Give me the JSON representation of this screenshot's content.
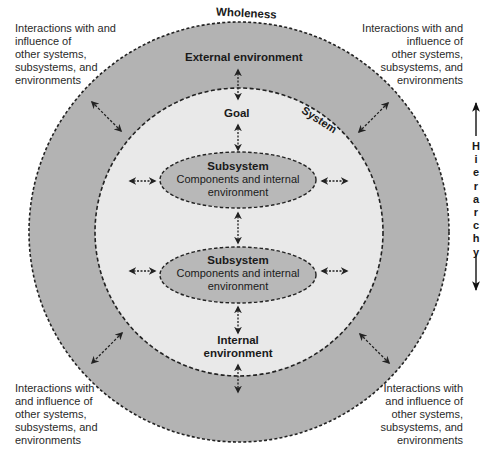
{
  "diagram": {
    "type": "nested-systems-diagram",
    "colors": {
      "background": "#ffffff",
      "outer_ring": "#b3b3b3",
      "inner_circle": "#e9e9e9",
      "subsystem_fill": "#b8b8b8",
      "outline": "#222222",
      "text": "#1a1a1a"
    },
    "labels": {
      "wholeness": "Wholeness",
      "external_environment": "External environment",
      "system": "System",
      "goal": "Goal",
      "internal_environment_line1": "Internal",
      "internal_environment_line2": "environment"
    },
    "subsystems": [
      {
        "title": "Subsystem",
        "line1": "Components and internal",
        "line2": "environment"
      },
      {
        "title": "Subsystem",
        "line1": "Components and internal",
        "line2": "environment"
      }
    ],
    "corner_notes": {
      "top_left": [
        "Interactions with and",
        "influence of",
        "other systems,",
        "subsystems, and",
        "environments"
      ],
      "top_right": [
        "Interactions with and",
        "influence of",
        "other systems,",
        "subsystems, and",
        "environments"
      ],
      "bottom_left": [
        "Interactions with",
        "and influence of",
        "other systems,",
        "subsystems, and",
        "environments"
      ],
      "bottom_right": [
        "Interactions with",
        "and influence of",
        "other systems,",
        "subsystems, and",
        "environments"
      ]
    },
    "hierarchy": {
      "label": "Hierarchy",
      "letters": [
        "H",
        "i",
        "e",
        "r",
        "a",
        "r",
        "c",
        "h",
        "y"
      ]
    },
    "arrow_icons": {
      "bidirectional": "double-headed-arrow",
      "hierarchy": "vertical-double-arrow"
    }
  }
}
